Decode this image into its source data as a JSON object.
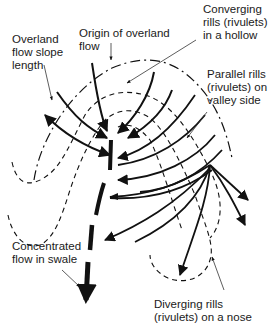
{
  "diagram": {
    "type": "rill-network-schematic",
    "colors": {
      "line": "#111111",
      "background": "#ffffff",
      "text": "#1a1a1a"
    },
    "labels": {
      "overland_flow_slope_length": [
        "Overland",
        "flow slope",
        "length"
      ],
      "origin_of_overland_flow": [
        "Origin of overland",
        "flow"
      ],
      "converging_rills": [
        "Converging",
        "rills (rivulets)",
        "in a hollow"
      ],
      "parallel_rills": [
        "Parallel rills",
        "(rivulets) on",
        "valley side"
      ],
      "concentrated_flow": [
        "Concentrated",
        "flow in swale"
      ],
      "diverging_rills": [
        "Diverging rills",
        "(rivulets)  on a nose"
      ]
    },
    "legend_line_styles": {
      "dash_dot": "Origin of overland flow (divide line)",
      "dashed": "Contour lines",
      "solid_arrow": "Rill (rivulet) flow direction",
      "thick_dashed_arrow": "Concentrated flow in swale"
    }
  }
}
